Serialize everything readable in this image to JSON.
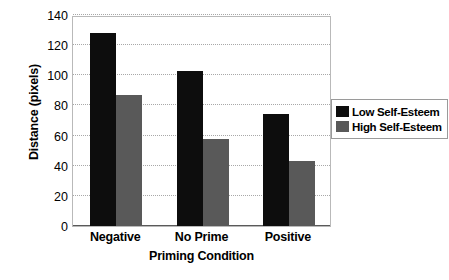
{
  "chart_data": {
    "type": "bar",
    "title": "",
    "xlabel": "Priming Condition",
    "ylabel": "Distance (pixels)",
    "categories": [
      "Negative",
      "No Prime",
      "Positive"
    ],
    "series": [
      {
        "name": "Low Self-Esteem",
        "color": "#0d0d0d",
        "values": [
          128,
          103,
          74
        ]
      },
      {
        "name": "High Self-Esteem",
        "color": "#595959",
        "values": [
          87,
          58,
          43
        ]
      }
    ],
    "ylim": [
      0,
      140
    ],
    "yticks": [
      0,
      20,
      40,
      60,
      80,
      100,
      120,
      140
    ],
    "ytick_labels": [
      "0",
      "20",
      "40",
      "60",
      "80",
      "100",
      "120",
      "140"
    ],
    "grid": true,
    "legend_position": "right"
  },
  "legend": {
    "items": [
      {
        "label": "Low Self-Esteem",
        "color": "#0d0d0d",
        "swatch_name": "legend-swatch-low-self-esteem"
      },
      {
        "label": "High Self-Esteem",
        "color": "#595959",
        "swatch_name": "legend-swatch-high-self-esteem"
      }
    ]
  }
}
